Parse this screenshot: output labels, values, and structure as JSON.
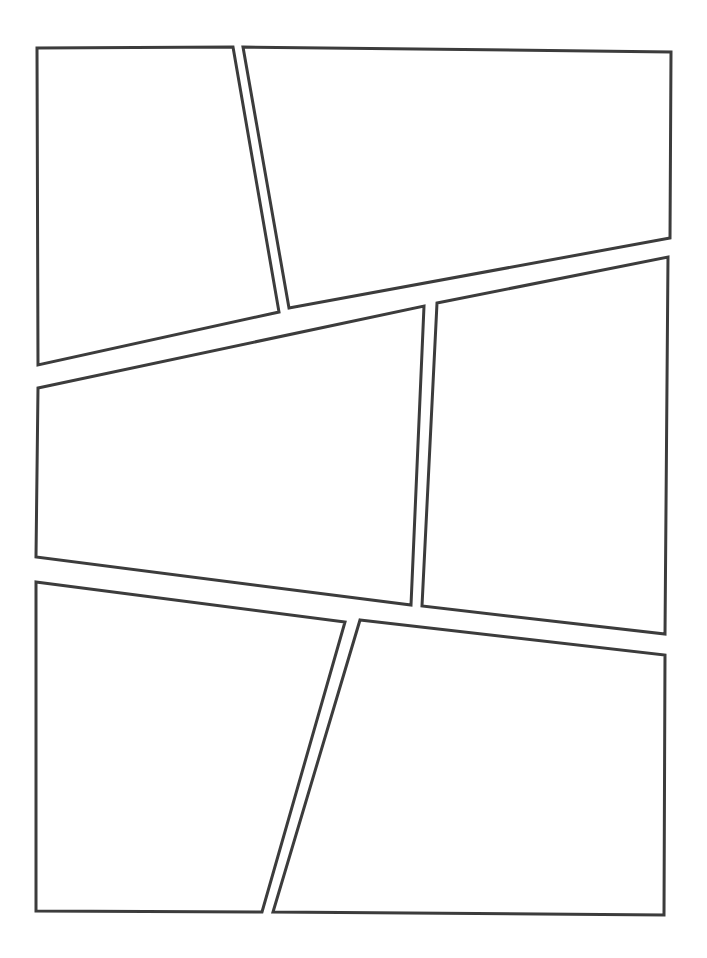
{
  "document": {
    "kind": "comic-page-layout-template",
    "title": "Blank Comic Page Layout",
    "width": 707,
    "height": 958,
    "background_color": "#ffffff",
    "stroke_color": "#3c3c3c",
    "stroke_width": 3,
    "panel_count": 6,
    "text_content": "",
    "notes": ""
  },
  "panels": [
    {
      "id": "panel-1",
      "label": "",
      "position": "top-left",
      "points": "37,48 233,47 279,312 38,365"
    },
    {
      "id": "panel-2",
      "label": "",
      "position": "top-right",
      "points": "243,47 671,52 670,238 289,308"
    },
    {
      "id": "panel-3",
      "label": "",
      "position": "middle-left",
      "points": "38,388 424,306 411,605 36,557"
    },
    {
      "id": "panel-4",
      "label": "",
      "position": "middle-right",
      "points": "437,303 668,257 665,634 422,606"
    },
    {
      "id": "panel-5",
      "label": "",
      "position": "bottom-left",
      "points": "36,582 345,622 262,912 36,911"
    },
    {
      "id": "panel-6",
      "label": "",
      "position": "bottom-right",
      "points": "360,620 665,655 664,915 273,912"
    }
  ]
}
